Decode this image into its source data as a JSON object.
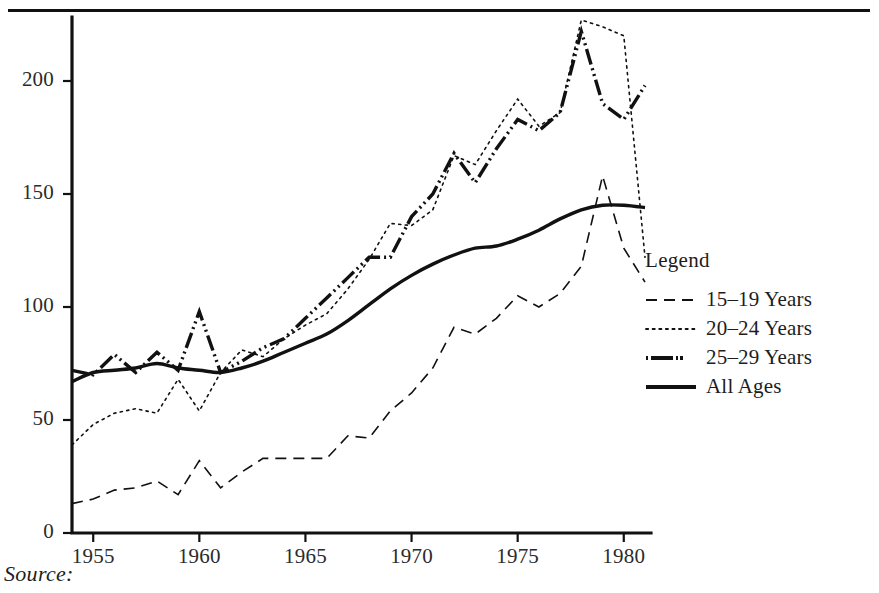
{
  "figure": {
    "source_label": "Source:",
    "legend_title": "Legend"
  },
  "chart_data": {
    "type": "line",
    "title": "",
    "xlabel": "",
    "ylabel": "",
    "xlim": [
      1954,
      1981
    ],
    "ylim": [
      0,
      230
    ],
    "grid": false,
    "legend_position": "right",
    "xticks": [
      1955,
      1960,
      1965,
      1970,
      1975,
      1980
    ],
    "xtick_labels": [
      "1955",
      "1960",
      "1965",
      "1970",
      "1975",
      "1980"
    ],
    "yticks": [
      0,
      50,
      100,
      150,
      200
    ],
    "ytick_labels": [
      "0",
      "50",
      "100",
      "150",
      "200"
    ],
    "x": [
      1954,
      1955,
      1956,
      1957,
      1958,
      1959,
      1960,
      1961,
      1962,
      1963,
      1964,
      1965,
      1966,
      1967,
      1968,
      1969,
      1970,
      1971,
      1972,
      1973,
      1974,
      1975,
      1976,
      1977,
      1978,
      1979,
      1980,
      1981
    ],
    "series": [
      {
        "name": "15-19 Years",
        "label": "15–19 Years",
        "style": "dashed",
        "width": 1.6,
        "color": "#111111",
        "values": [
          13,
          15,
          19,
          20,
          23,
          17,
          32,
          20,
          27,
          33,
          33,
          33,
          33,
          43,
          42,
          54,
          62,
          73,
          91,
          88,
          95,
          105,
          100,
          106,
          118,
          158,
          126,
          111
        ]
      },
      {
        "name": "20-24 Years",
        "label": "20–24 Years",
        "style": "dotted",
        "width": 1.6,
        "color": "#111111",
        "values": [
          39,
          48,
          53,
          55,
          53,
          68,
          54,
          71,
          81,
          78,
          86,
          92,
          97,
          108,
          121,
          137,
          136,
          143,
          167,
          163,
          178,
          192,
          180,
          186,
          227,
          224,
          220,
          122
        ]
      },
      {
        "name": "25-29 Years",
        "label": "25–29 Years",
        "style": "dashdotdot",
        "width": 3.4,
        "color": "#111111",
        "values": [
          72,
          70,
          79,
          71,
          80,
          72,
          98,
          71,
          76,
          82,
          86,
          95,
          104,
          113,
          122,
          122,
          140,
          150,
          168,
          155,
          170,
          183,
          178,
          186,
          222,
          190,
          183,
          198
        ]
      },
      {
        "name": "All Ages",
        "label": "All Ages",
        "style": "solid",
        "width": 3.4,
        "color": "#111111",
        "values": [
          67,
          71,
          72,
          73,
          75,
          73,
          72,
          71,
          73,
          76,
          80,
          84,
          88,
          94,
          101,
          108,
          114,
          119,
          123,
          126,
          127,
          130,
          134,
          139,
          143,
          145,
          145,
          144
        ]
      }
    ]
  }
}
